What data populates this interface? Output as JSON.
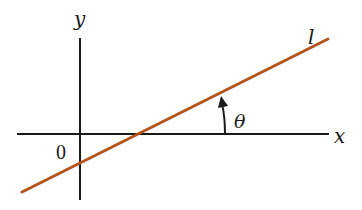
{
  "diagram": {
    "labels": {
      "y_axis": "y",
      "x_axis": "x",
      "origin": "0",
      "line": "l",
      "angle": "θ"
    },
    "colors": {
      "axes": "#1a1a1a",
      "line": "#b5531f",
      "background": "#ffffff"
    }
  }
}
